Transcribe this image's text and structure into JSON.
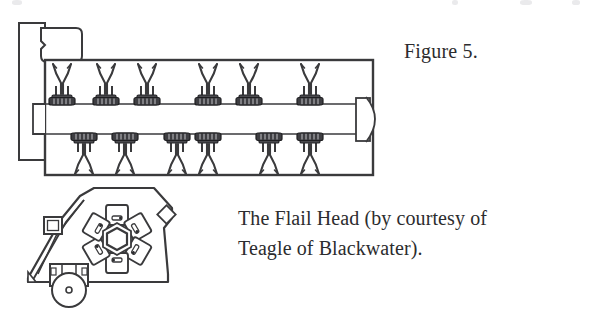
{
  "page": {
    "width": 599,
    "height": 313,
    "background": "#ffffff",
    "ink_color": "#2c2c2e",
    "line_color": "#3a3a3c"
  },
  "figure": {
    "label": "Figure 5.",
    "caption_lines": [
      "The Flail Head (by courtesy of",
      "Teagle of Blackwater)."
    ],
    "caption_full": "The Flail Head (by courtesy of Teagle of Blackwater)."
  },
  "top_view": {
    "name": "flail-mower-top-view",
    "description": "Plan view of flail mower rotor housing",
    "upper_flail_count": 6,
    "lower_flail_count": 6,
    "upper_flail_x": [
      62,
      106,
      147,
      208,
      249,
      310
    ],
    "lower_flail_x": [
      84,
      125,
      177,
      208,
      269,
      310
    ],
    "housing": {
      "x": 44,
      "y": 60,
      "width": 328,
      "height": 115
    },
    "shaft": {
      "y_top": 104,
      "y_bottom": 133
    },
    "gearbox": {
      "x": 40,
      "y": 27,
      "width": 40,
      "height": 30
    },
    "side_plate": {
      "x": 18,
      "y": 22,
      "width": 26,
      "height": 137
    },
    "bearing_block": {
      "x": 355,
      "y": 98,
      "width": 14,
      "height": 40
    }
  },
  "head_view": {
    "name": "flail-head-cross-section",
    "description": "Cross-section of the flail head showing rotor and flails",
    "rotor_blade_count": 6,
    "rotor_hub_shape": "hexagon",
    "roller_present": true,
    "hood_bracket_present": true
  }
}
